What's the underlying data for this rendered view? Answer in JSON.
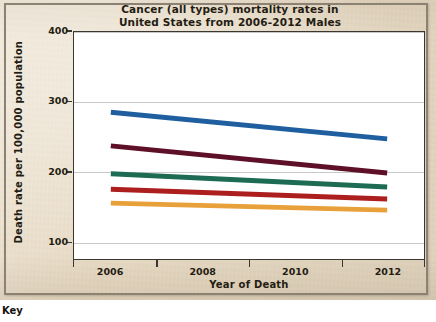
{
  "page": {
    "key_label": "Key",
    "paper_color": "#e9dcc6",
    "frame_color": "#8b8274"
  },
  "chart_data": {
    "type": "line",
    "title": "Cancer (all types) mortality rates in United States from 2006-2012 Males",
    "title_lines": [
      "Cancer (all types) mortality rates in",
      "United States from 2006-2012 Males"
    ],
    "xlabel": "Year of Death",
    "ylabel": "Death rate per 100,000 population",
    "x": [
      2006,
      2012
    ],
    "xlim": [
      2005.2,
      2012.8
    ],
    "ylim": [
      75,
      400
    ],
    "xticks": [
      2006,
      2008,
      2010,
      2012
    ],
    "xtick_labels": [
      "2006",
      "2008",
      "2010",
      "2012"
    ],
    "yticks": [
      100,
      200,
      300,
      400
    ],
    "ytick_labels": [
      "100",
      "200",
      "300",
      "400"
    ],
    "grid": "horizontal",
    "legend": "none",
    "series": [
      {
        "name": "series-1",
        "color": "#1f5fa0",
        "values": [
          285,
          247
        ]
      },
      {
        "name": "series-2",
        "color": "#5e1028",
        "values": [
          237,
          198
        ]
      },
      {
        "name": "series-3",
        "color": "#1d6b52",
        "values": [
          197,
          178
        ]
      },
      {
        "name": "series-4",
        "color": "#ad1f1f",
        "values": [
          175,
          161
        ]
      },
      {
        "name": "series-5",
        "color": "#e8a13a",
        "values": [
          155,
          145
        ]
      }
    ]
  }
}
